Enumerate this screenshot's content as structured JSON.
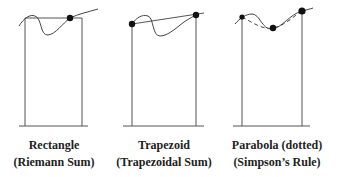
{
  "panels": [
    {
      "id": "rectangle",
      "title": "Rectangle",
      "subtitle": "(Riemann Sum)"
    },
    {
      "id": "trapezoid",
      "title": "Trapezoid",
      "subtitle": "(Trapezoidal Sum)"
    },
    {
      "id": "parabola",
      "title": "Parabola (dotted)",
      "subtitle": "(Simpson’s Rule)"
    }
  ],
  "colors": {
    "line": "#555555",
    "curve": "#444444",
    "dot": "#111111",
    "text": "#222222"
  }
}
